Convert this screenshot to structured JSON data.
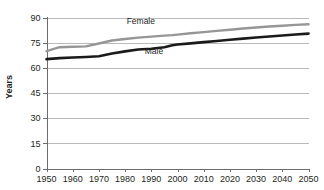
{
  "chart_data": {
    "type": "line",
    "title": "",
    "xlabel": "",
    "ylabel": "Years",
    "xlim": [
      1950,
      2050
    ],
    "ylim": [
      0,
      90
    ],
    "yticks": [
      0,
      15,
      30,
      45,
      60,
      75,
      90
    ],
    "ytick_labels": [
      "0",
      "15",
      "30",
      "45",
      "60",
      "75",
      "90"
    ],
    "xticks": [
      1950,
      1960,
      1970,
      1980,
      1990,
      2000,
      2010,
      2020,
      2030,
      2040,
      2050
    ],
    "xtick_labels": [
      "1950",
      "1960",
      "1970",
      "1980",
      "1990",
      "2000",
      "2010",
      "2020",
      "2030",
      "2040",
      "2050"
    ],
    "grid": true,
    "grid_axis": "y",
    "legend_position": "inline-annotations",
    "x": [
      1950,
      1955,
      1960,
      1965,
      1970,
      1975,
      1980,
      1985,
      1990,
      1995,
      1998,
      2000,
      2005,
      2010,
      2015,
      2020,
      2025,
      2030,
      2035,
      2040,
      2045,
      2050
    ],
    "series": [
      {
        "name": "Female",
        "color": "#969696",
        "values": [
          70.0,
          72.3,
          72.6,
          72.8,
          74.5,
          76.3,
          77.2,
          78.0,
          78.6,
          79.2,
          79.5,
          79.8,
          80.6,
          81.3,
          82.0,
          82.7,
          83.4,
          84.0,
          84.6,
          85.1,
          85.6,
          86.0
        ]
      },
      {
        "name": "Male",
        "color": "#1a1a1a",
        "values": [
          65.2,
          65.8,
          66.2,
          66.5,
          66.9,
          68.5,
          69.8,
          70.9,
          71.4,
          72.3,
          73.5,
          73.9,
          74.6,
          75.3,
          76.0,
          76.7,
          77.4,
          78.1,
          78.7,
          79.3,
          79.9,
          80.4
        ]
      }
    ],
    "annotations": [
      {
        "text": "Female",
        "x": 1986,
        "y": 86.3,
        "series": "Female"
      },
      {
        "text": "Male",
        "x": 1991,
        "y": 68.5,
        "series": "Male"
      }
    ]
  }
}
